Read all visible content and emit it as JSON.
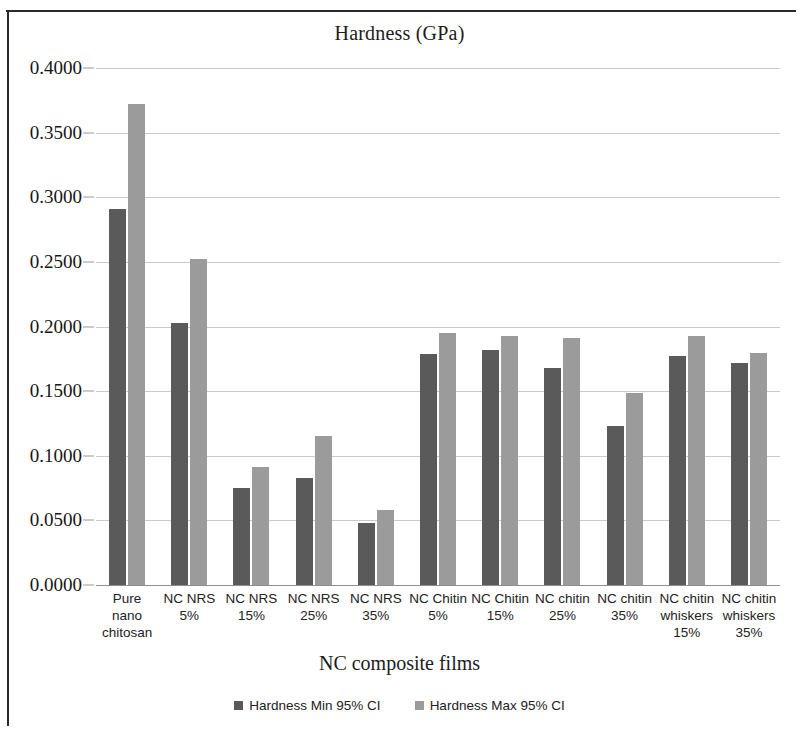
{
  "chart_data": {
    "type": "bar",
    "title": "Hardness (GPa)",
    "xlabel": "NC composite films",
    "ylabel": "",
    "ylim": [
      0.0,
      0.4
    ],
    "grid": true,
    "legend_position": "bottom",
    "ytick_labels": [
      "0.4000",
      "0.3500",
      "0.3000",
      "0.2500",
      "0.2000",
      "0.1500",
      "0.1000",
      "0.0500",
      "0.0000"
    ],
    "ytick_values": [
      0.4,
      0.35,
      0.3,
      0.25,
      0.2,
      0.15,
      0.1,
      0.05,
      0.0
    ],
    "categories": [
      "Pure nano chitosan",
      "NC NRS 5%",
      "NC NRS 15%",
      "NC NRS 25%",
      "NC NRS 35%",
      "NC Chitin 5%",
      "NC Chitin 15%",
      "NC  chitin 25%",
      "NC chitin 35%",
      "NC chitin whiskers 15%",
      "NC chitin whiskers 35%"
    ],
    "series": [
      {
        "name": "Hardness Min 95% CI",
        "color": "#5a5a5a",
        "values": [
          0.291,
          0.2025,
          0.075,
          0.083,
          0.048,
          0.179,
          0.182,
          0.168,
          0.123,
          0.1775,
          0.172
        ]
      },
      {
        "name": "Hardness Max 95% CI",
        "color": "#9b9b9b",
        "values": [
          0.3725,
          0.2525,
          0.0915,
          0.1155,
          0.058,
          0.195,
          0.193,
          0.191,
          0.1485,
          0.1925,
          0.1795
        ]
      }
    ]
  }
}
